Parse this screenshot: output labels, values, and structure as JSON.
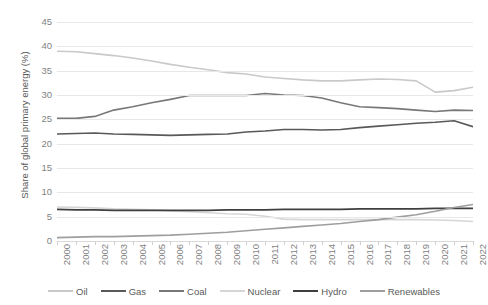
{
  "chart_data": {
    "type": "line",
    "title": "",
    "xlabel": "",
    "ylabel": "Share of global primary energy (%)",
    "ylim": [
      0,
      45
    ],
    "yticks": [
      0,
      5,
      10,
      15,
      20,
      25,
      30,
      35,
      40,
      45
    ],
    "grid": true,
    "legend_position": "bottom",
    "x": [
      2000,
      2001,
      2002,
      2003,
      2004,
      2005,
      2006,
      2007,
      2008,
      2009,
      2010,
      2011,
      2012,
      2013,
      2014,
      2015,
      2016,
      2017,
      2018,
      2019,
      2020,
      2021,
      2022
    ],
    "categories": [
      "2000",
      "2001",
      "2002",
      "2003",
      "2004",
      "2005",
      "2006",
      "2007",
      "2008",
      "2009",
      "2010",
      "2011",
      "2012",
      "2013",
      "2014",
      "2015",
      "2016",
      "2017",
      "2018",
      "2019",
      "2020",
      "2021",
      "2022"
    ],
    "series": [
      {
        "name": "Oil",
        "color": "#c9c9c9",
        "values": [
          39.0,
          38.9,
          38.5,
          38.1,
          37.6,
          37.0,
          36.3,
          35.7,
          35.2,
          34.6,
          34.3,
          33.7,
          33.4,
          33.1,
          32.9,
          32.9,
          33.1,
          33.3,
          33.2,
          32.9,
          30.6,
          30.9,
          31.6
        ]
      },
      {
        "name": "Gas",
        "color": "#595959",
        "values": [
          22.0,
          22.1,
          22.2,
          22.0,
          21.9,
          21.8,
          21.7,
          21.8,
          21.9,
          22.0,
          22.4,
          22.6,
          22.9,
          22.9,
          22.8,
          22.9,
          23.3,
          23.6,
          23.9,
          24.2,
          24.4,
          24.7,
          23.5
        ]
      },
      {
        "name": "Coal",
        "color": "#787878",
        "values": [
          25.2,
          25.2,
          25.6,
          26.9,
          27.6,
          28.4,
          29.1,
          29.9,
          29.9,
          29.9,
          29.9,
          30.3,
          30.0,
          29.9,
          29.4,
          28.4,
          27.6,
          27.4,
          27.2,
          26.9,
          26.6,
          26.9,
          26.8
        ]
      },
      {
        "name": "Nuclear",
        "color": "#d6d6d6",
        "values": [
          7.0,
          6.9,
          6.8,
          6.6,
          6.5,
          6.4,
          6.2,
          6.0,
          5.8,
          5.6,
          5.5,
          5.1,
          4.5,
          4.4,
          4.4,
          4.4,
          4.4,
          4.4,
          4.4,
          4.4,
          4.3,
          4.2,
          4.0
        ]
      },
      {
        "name": "Hydro",
        "color": "#3f3f3f",
        "values": [
          6.5,
          6.4,
          6.4,
          6.3,
          6.3,
          6.3,
          6.3,
          6.3,
          6.3,
          6.4,
          6.4,
          6.4,
          6.5,
          6.5,
          6.5,
          6.5,
          6.6,
          6.6,
          6.6,
          6.6,
          6.7,
          6.7,
          6.7
        ]
      },
      {
        "name": "Renewables",
        "color": "#9e9e9e",
        "values": [
          0.7,
          0.8,
          0.9,
          0.9,
          1.0,
          1.1,
          1.2,
          1.4,
          1.6,
          1.8,
          2.1,
          2.4,
          2.7,
          3.0,
          3.3,
          3.6,
          4.0,
          4.4,
          4.9,
          5.4,
          6.1,
          6.9,
          7.5
        ]
      }
    ]
  },
  "axis": {
    "y_title": "Share of global primary energy (%)"
  },
  "legend": {
    "items": [
      {
        "label": "Oil",
        "color": "#c9c9c9"
      },
      {
        "label": "Gas",
        "color": "#595959"
      },
      {
        "label": "Coal",
        "color": "#787878"
      },
      {
        "label": "Nuclear",
        "color": "#d6d6d6"
      },
      {
        "label": "Hydro",
        "color": "#3f3f3f"
      },
      {
        "label": "Renewables",
        "color": "#9e9e9e"
      }
    ]
  }
}
